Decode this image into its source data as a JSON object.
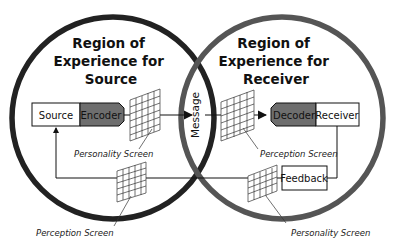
{
  "diagram": {
    "title_source": [
      "Region of",
      "Experience for",
      "Source"
    ],
    "title_receiver": [
      "Region of",
      "Experience for",
      "Receiver"
    ],
    "boxes": {
      "source": "Source",
      "encoder": "Encoder",
      "decoder": "Decoder",
      "receiver": "Receiver",
      "feedback": "Feedback"
    },
    "message": "Message",
    "screens": {
      "source_personality": "Personality Screen",
      "receiver_perception": "Perception Screen",
      "source_perception": "Perception Screen",
      "receiver_personality": "Personality Screen"
    },
    "colors": {
      "source_circle": "#222222",
      "receiver_circle": "#555555",
      "coder_fill": "#6e6e6e",
      "line": "#111111"
    }
  }
}
